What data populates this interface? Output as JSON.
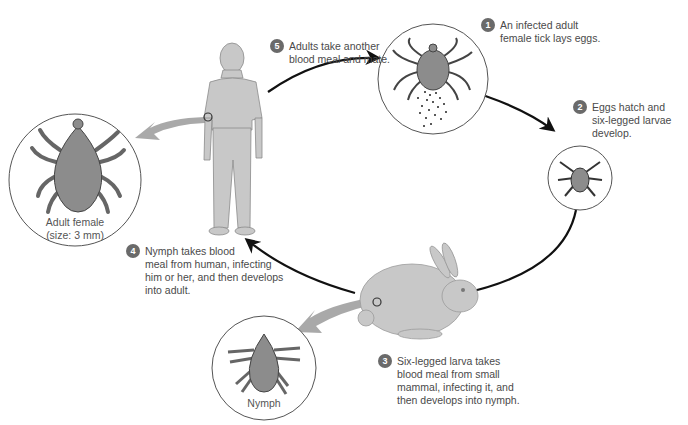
{
  "diagram": {
    "colors": {
      "background": "#ffffff",
      "tick_body": "#8c8c8c",
      "tick_outline": "#4a4a4a",
      "host_fill": "#c8c8c8",
      "pointer_arrow": "#a9a9a9",
      "cycle_arrow": "#111111",
      "step_badge": "#6a6a6a",
      "text": "#4a4a4a"
    },
    "steps": [
      {
        "number": "1",
        "line1": "An infected adult",
        "line2": "female tick lays eggs.",
        "line3": "",
        "line4": ""
      },
      {
        "number": "2",
        "line1": "Eggs hatch and",
        "line2": "six-legged larvae",
        "line3": "develop.",
        "line4": ""
      },
      {
        "number": "3",
        "line1": "Six-legged larva takes",
        "line2": "blood meal from small",
        "line3": "mammal, infecting it, and",
        "line4": "then develops into nymph."
      },
      {
        "number": "4",
        "line1": "Nymph takes blood",
        "line2": "meal from human, infecting",
        "line3": "him or her, and then develops",
        "line4": "into adult."
      },
      {
        "number": "5",
        "line1": "Adults take another",
        "line2": "blood meal and mate.",
        "line3": "",
        "line4": ""
      }
    ],
    "insets": {
      "adult_female": {
        "label1": "Adult female",
        "label2": "(size: 3 mm)"
      },
      "nymph": {
        "label": "Nymph"
      }
    },
    "nodes": [
      "egg-laying-tick",
      "larva",
      "rabbit-host",
      "human-host"
    ]
  }
}
